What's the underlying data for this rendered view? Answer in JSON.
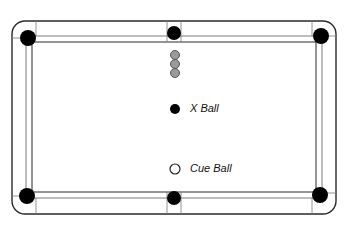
{
  "diagram": {
    "title": "",
    "colors": {
      "line": "#2a2a2a",
      "inner_line": "#7a7a7a",
      "pocket": "#000000",
      "object_ball": "#9a9a9a",
      "object_ball_stroke": "#555555",
      "x_ball": "#000000",
      "cue_ball_fill": "#ffffff",
      "cue_ball_stroke": "#222222",
      "background": "#ffffff"
    },
    "table": {
      "outer": {
        "x": 12,
        "y": 21,
        "w": 324,
        "h": 193,
        "r": 13
      },
      "cushion_outer": {
        "x": 26,
        "y": 36,
        "w": 296,
        "h": 162
      },
      "cushion_inner": {
        "x": 32,
        "y": 42,
        "w": 284,
        "h": 150
      }
    },
    "pockets": [
      {
        "name": "top-left",
        "cx": 28,
        "cy": 38,
        "r": 8
      },
      {
        "name": "top-middle",
        "cx": 174,
        "cy": 33,
        "r": 7
      },
      {
        "name": "top-right",
        "cx": 321,
        "cy": 36,
        "r": 8
      },
      {
        "name": "bottom-left",
        "cx": 27,
        "cy": 196,
        "r": 8
      },
      {
        "name": "bottom-middle",
        "cx": 174,
        "cy": 198,
        "r": 7
      },
      {
        "name": "bottom-right",
        "cx": 320,
        "cy": 195,
        "r": 8
      }
    ],
    "object_balls": [
      {
        "cx": 175,
        "cy": 55,
        "r": 4.5
      },
      {
        "cx": 175,
        "cy": 64,
        "r": 4.5
      },
      {
        "cx": 175,
        "cy": 73,
        "r": 4.5
      }
    ],
    "x_ball": {
      "cx": 175,
      "cy": 109,
      "r": 5,
      "label": "X Ball",
      "label_x": 190,
      "label_y": 103
    },
    "cue_ball": {
      "cx": 175,
      "cy": 169,
      "r": 5,
      "label": "Cue Ball",
      "label_x": 190,
      "label_y": 163
    }
  }
}
